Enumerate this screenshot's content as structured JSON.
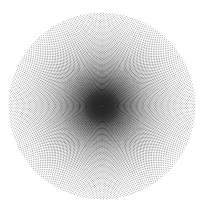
{
  "figure": {
    "title": "Concentric Radial Dot Pattern",
    "background_color": "#ffffff",
    "dot_color": "#2b2b2b",
    "canvas_width": 204,
    "canvas_height": 214
  },
  "chart_data": {
    "type": "scatter",
    "title": "Concentric Radial Dot Pattern",
    "subtitle": "",
    "xlabel": "",
    "ylabel": "",
    "grid": false,
    "legend": "none",
    "xlim": [
      0,
      204
    ],
    "ylim": [
      0,
      214
    ],
    "geometry": {
      "center_x": 102,
      "center_y": 106,
      "outer_radius": 94,
      "inner_radius": 1.2,
      "ring_count": 78,
      "angular_divisions": 200,
      "ring_spacing": 1.19,
      "dot_radius_min": 0.42,
      "dot_radius_max": 0.62,
      "angular_offset_per_ring_deg": 0.9,
      "color": "#2b2b2b",
      "opacity_min": 0.55,
      "opacity_max": 0.95
    },
    "series": [
      {
        "name": "ring-dots",
        "generator": "polar_lattice",
        "description": "For ring index i in 0..ring_count-1: r = inner_radius + i * ring_spacing; for angular index j in 0..angular_divisions-1: theta = j * 360/angular_divisions + i * angular_offset_per_ring_deg; dot at (center_x + r*cos(theta), center_y + r*sin(theta))."
      }
    ]
  }
}
